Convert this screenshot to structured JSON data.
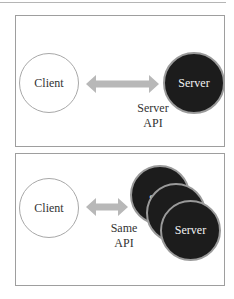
{
  "diagram": {
    "top_panel": {
      "client_label": "Client",
      "server_label": "Server",
      "api_label_line1": "Server",
      "api_label_line2": "API"
    },
    "bottom_panel": {
      "client_label": "Client",
      "server_labels": [
        "Server",
        "Server",
        "Server"
      ],
      "api_label_line1": "Same",
      "api_label_line2": "API"
    },
    "colors": {
      "arrow": "#b8b8b8",
      "server_fill": "#1c1c1c",
      "server_border": "#9a9a9a",
      "client_border": "#a8a8a8",
      "panel_border": "#9e9e9e"
    }
  }
}
